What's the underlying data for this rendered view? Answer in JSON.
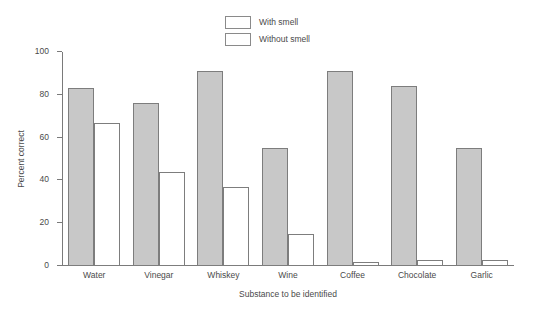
{
  "chart_data": {
    "type": "bar",
    "title": "",
    "xlabel": "Substance to be identified",
    "ylabel": "Percent correct",
    "categories": [
      "Water",
      "Vinegar",
      "Whiskey",
      "Wine",
      "Coffee",
      "Chocolate",
      "Garlic"
    ],
    "series": [
      {
        "name": "With smell",
        "values": [
          83,
          76,
          91,
          55,
          91,
          84,
          55
        ],
        "color": "#c8c8c8"
      },
      {
        "name": "Without smell",
        "values": [
          67,
          44,
          37,
          15,
          2,
          3,
          3
        ],
        "color": "#ffffff"
      }
    ],
    "ylim": [
      0,
      100
    ],
    "yticks": [
      0,
      20,
      40,
      60,
      80,
      100
    ],
    "ytick_labels": [
      "0",
      "20",
      "40",
      "60",
      "80",
      "100"
    ],
    "grid": false,
    "legend_position": "top-center",
    "legend_entries": [
      "With smell",
      "Without smell"
    ]
  },
  "axes": {
    "y_title": "Percent correct",
    "x_title": "Substance to be identified"
  },
  "legend": {
    "items": [
      {
        "label": "With smell"
      },
      {
        "label": "Without smell"
      }
    ]
  }
}
